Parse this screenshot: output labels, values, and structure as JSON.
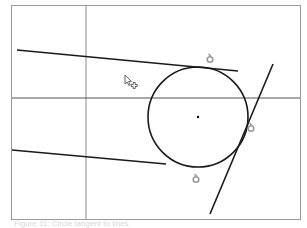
{
  "figure": {
    "type": "cad-tangent-constraint-illustration",
    "frame": {
      "x": 11,
      "y": 5,
      "width": 289,
      "height": 214,
      "stroke": "#9a9a9a"
    },
    "axes": {
      "vertical_x": 86,
      "horizontal_y": 98,
      "vertical_stroke": "#8a8a8a",
      "horizontal_stroke": "#555555"
    },
    "circle": {
      "cx": 198,
      "cy": 117,
      "r": 50,
      "stroke": "#1a1a1a",
      "center_dot": true
    },
    "lines": [
      {
        "name": "upper-line",
        "x1": 17,
        "y1": 50,
        "x2": 238,
        "y2": 71
      },
      {
        "name": "lower-line",
        "x1": 12,
        "y1": 150,
        "x2": 166,
        "y2": 164
      },
      {
        "name": "steep-line",
        "x1": 273,
        "y1": 64,
        "x2": 210,
        "y2": 214
      }
    ],
    "tangent_markers": [
      {
        "name": "tangent-marker-top",
        "x": 210,
        "y": 58
      },
      {
        "name": "tangent-marker-right",
        "x": 251,
        "y": 127
      },
      {
        "name": "tangent-marker-bottom",
        "x": 196,
        "y": 178
      }
    ],
    "marker_color": "#9a9a9a",
    "cursor": {
      "x": 125,
      "y": 75,
      "icon": "arrow-with-plus-cursor"
    }
  },
  "caption": {
    "text": "Figure 11: Circle tangent to lines"
  }
}
